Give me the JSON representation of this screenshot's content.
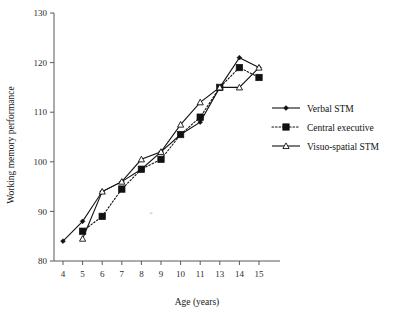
{
  "chart_data": {
    "type": "line",
    "title": "",
    "xlabel": "Age (years)",
    "ylabel": "Working memory performance",
    "categories": [
      "4",
      "5",
      "6",
      "7",
      "8",
      "9",
      "10",
      "11",
      "13",
      "14",
      "15"
    ],
    "x": [
      4,
      5,
      6,
      7,
      8,
      9,
      10,
      11,
      13,
      14,
      15
    ],
    "xlim": [
      3.5,
      15.5
    ],
    "ylim": [
      80,
      130
    ],
    "yticks": [
      80,
      90,
      100,
      110,
      120,
      130
    ],
    "xticks": [
      4,
      5,
      6,
      7,
      8,
      9,
      10,
      11,
      13,
      14,
      15
    ],
    "grid": false,
    "legend_position": "right",
    "series": [
      {
        "name": "Verbal STM",
        "marker": "filled-diamond",
        "line_style": "solid",
        "color": "#111111",
        "values": [
          84,
          88,
          94,
          96,
          98.5,
          102,
          105.5,
          108,
          115,
          121,
          119
        ]
      },
      {
        "name": "Central executive",
        "marker": "filled-square",
        "line_style": "dotted",
        "color": "#111111",
        "values": [
          null,
          86,
          89,
          94.5,
          98.5,
          100.5,
          105.5,
          109,
          115,
          119,
          117
        ]
      },
      {
        "name": "Visuo-spatial STM",
        "marker": "open-triangle",
        "line_style": "solid",
        "color": "#111111",
        "values": [
          null,
          84.5,
          94,
          96,
          100.5,
          102,
          107.5,
          112,
          115,
          115,
          119
        ]
      }
    ],
    "annotations": [
      {
        "name": "stray-asterisk",
        "text": "*",
        "x": 8.85,
        "y": 89
      }
    ]
  },
  "axes": {
    "y_tick_labels": [
      "80",
      "90",
      "100",
      "110",
      "120",
      "130"
    ],
    "x_tick_labels": [
      "4",
      "5",
      "6",
      "7",
      "8",
      "9",
      "10",
      "11",
      "13",
      "14",
      "15"
    ],
    "x_axis_title": "Age (years)",
    "y_axis_title": "Working memory performance"
  },
  "legend": {
    "entries": [
      {
        "label": "Verbal STM"
      },
      {
        "label": "Central executive"
      },
      {
        "label": "Visuo-spatial STM"
      }
    ]
  }
}
